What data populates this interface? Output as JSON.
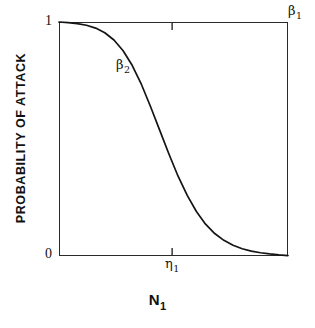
{
  "chart_data": {
    "type": "line",
    "title": "",
    "subtitle": "",
    "xlabel": "N",
    "xlabel_sub": "1",
    "ylabel": "PROBABILITY OF ATTACK",
    "ylim": [
      0,
      1
    ],
    "xlim": [
      0,
      1
    ],
    "grid": false,
    "legend": "none",
    "y_tick_labels": [
      "1",
      "0"
    ],
    "y_tick_values": [
      1,
      0
    ],
    "x_tick_labels": [
      "η"
    ],
    "x_tick_sub": "1",
    "x_tick_values": [
      0.494
    ],
    "annotations": [
      {
        "text": "β",
        "sub": "1",
        "x": 1.0,
        "y": 1.06,
        "placement": "top-right-outside"
      },
      {
        "text": "β",
        "sub": "2",
        "x": 0.25,
        "y": 0.82,
        "placement": "inside-upper-left"
      }
    ],
    "series": [
      {
        "name": "probability of attack",
        "curve": "logistic-decreasing",
        "x": [
          0.0,
          0.04,
          0.08,
          0.12,
          0.16,
          0.2,
          0.24,
          0.28,
          0.32,
          0.36,
          0.4,
          0.44,
          0.48,
          0.52,
          0.56,
          0.6,
          0.64,
          0.68,
          0.72,
          0.76,
          0.8,
          0.84,
          0.88,
          0.92,
          0.96,
          1.0
        ],
        "y": [
          1.0,
          0.997,
          0.993,
          0.986,
          0.974,
          0.954,
          0.923,
          0.877,
          0.814,
          0.733,
          0.638,
          0.537,
          0.436,
          0.341,
          0.259,
          0.19,
          0.136,
          0.096,
          0.067,
          0.046,
          0.031,
          0.021,
          0.014,
          0.009,
          0.005,
          0.002
        ]
      }
    ]
  },
  "axes": {
    "frame": {
      "left": 59,
      "top": 22,
      "width": 229,
      "height": 234
    },
    "line_color": "#2a2a2a",
    "curve_color": "#141414",
    "background": "#ffffff"
  }
}
